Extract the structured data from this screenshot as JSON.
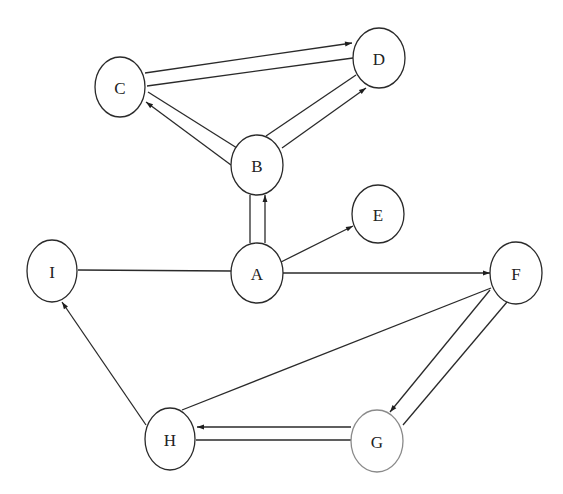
{
  "diagram": {
    "type": "directed-graph",
    "nodes": [
      {
        "id": "A",
        "label": "A",
        "cx": 257,
        "cy": 273,
        "rx": 26,
        "ry": 30,
        "light": false
      },
      {
        "id": "B",
        "label": "B",
        "cx": 257,
        "cy": 165,
        "rx": 26,
        "ry": 30,
        "light": false
      },
      {
        "id": "C",
        "label": "C",
        "cx": 120,
        "cy": 87,
        "rx": 25,
        "ry": 30,
        "light": false
      },
      {
        "id": "D",
        "label": "D",
        "cx": 379,
        "cy": 58,
        "rx": 26,
        "ry": 30,
        "light": false
      },
      {
        "id": "E",
        "label": "E",
        "cx": 378,
        "cy": 214,
        "rx": 26,
        "ry": 29,
        "light": false
      },
      {
        "id": "F",
        "label": "F",
        "cx": 516,
        "cy": 273,
        "rx": 26,
        "ry": 31,
        "light": false
      },
      {
        "id": "G",
        "label": "G",
        "cx": 377,
        "cy": 441,
        "rx": 26,
        "ry": 31,
        "light": true
      },
      {
        "id": "H",
        "label": "H",
        "cx": 170,
        "cy": 439,
        "rx": 25,
        "ry": 31,
        "light": false
      },
      {
        "id": "I",
        "label": "I",
        "cx": 52,
        "cy": 271,
        "rx": 25,
        "ry": 31,
        "light": false
      }
    ],
    "edges": [
      {
        "from": "C",
        "to": "D",
        "x1": 145,
        "y1": 73,
        "x2": 352,
        "y2": 43,
        "arrow": true
      },
      {
        "from": "D",
        "to": "C",
        "x1": 353,
        "y1": 58,
        "x2": 147,
        "y2": 86,
        "arrow": false
      },
      {
        "from": "B",
        "to": "C",
        "x1": 231,
        "y1": 165,
        "x2": 146,
        "y2": 102,
        "arrow": true
      },
      {
        "from": "B",
        "to": "C",
        "x1": 237,
        "y1": 148,
        "x2": 148,
        "y2": 92,
        "arrow": false
      },
      {
        "from": "B",
        "to": "D",
        "x1": 266,
        "y1": 136,
        "x2": 356,
        "y2": 75,
        "arrow": false
      },
      {
        "from": "B",
        "to": "D",
        "x1": 282,
        "y1": 148,
        "x2": 366,
        "y2": 88,
        "arrow": true
      },
      {
        "from": "A",
        "to": "B",
        "x1": 250,
        "y1": 243,
        "x2": 250,
        "y2": 195,
        "arrow": false
      },
      {
        "from": "A",
        "to": "B",
        "x1": 265,
        "y1": 243,
        "x2": 265,
        "y2": 195,
        "arrow": true
      },
      {
        "from": "A",
        "to": "E",
        "x1": 281,
        "y1": 262,
        "x2": 353,
        "y2": 226,
        "arrow": true
      },
      {
        "from": "A",
        "to": "F",
        "x1": 283,
        "y1": 273,
        "x2": 490,
        "y2": 273,
        "arrow": true
      },
      {
        "from": "I",
        "to": "A",
        "x1": 78,
        "y1": 270,
        "x2": 231,
        "y2": 271,
        "arrow": false
      },
      {
        "from": "F",
        "to": "G",
        "x1": 490,
        "y1": 290,
        "x2": 390,
        "y2": 412,
        "arrow": true
      },
      {
        "from": "G",
        "to": "F",
        "x1": 403,
        "y1": 425,
        "x2": 507,
        "y2": 302,
        "arrow": false
      },
      {
        "from": "F",
        "to": "H",
        "x1": 491,
        "y1": 288,
        "x2": 182,
        "y2": 410,
        "arrow": false
      },
      {
        "from": "G",
        "to": "H",
        "x1": 351,
        "y1": 427,
        "x2": 197,
        "y2": 427,
        "arrow": true
      },
      {
        "from": "G",
        "to": "H",
        "x1": 351,
        "y1": 440,
        "x2": 196,
        "y2": 440,
        "arrow": false
      },
      {
        "from": "H",
        "to": "I",
        "x1": 146,
        "y1": 425,
        "x2": 62,
        "y2": 302,
        "arrow": true
      }
    ],
    "colors": {
      "stroke": "#2a2a2a",
      "light_stroke": "#8a8a8a",
      "background": "#ffffff"
    }
  }
}
